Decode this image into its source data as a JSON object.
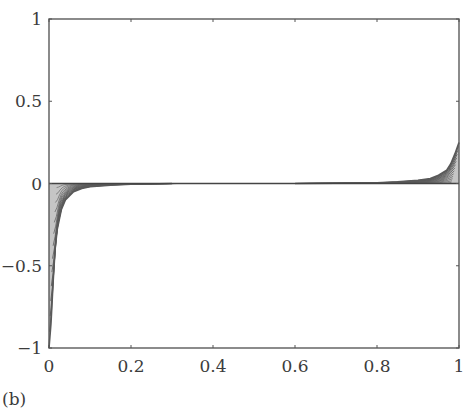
{
  "figure": {
    "panel_label": "(b)"
  },
  "chart_data": {
    "type": "line",
    "title": "",
    "xlabel": "",
    "ylabel": "",
    "xlim": [
      0,
      1
    ],
    "ylim": [
      -1,
      1
    ],
    "grid": false,
    "legend": null,
    "x_ticks": [
      0,
      0.2,
      0.4,
      0.6,
      0.8,
      1
    ],
    "x_tick_labels": [
      "0",
      "0.2",
      "0.4",
      "0.6",
      "0.8",
      "1"
    ],
    "y_ticks": [
      -1,
      -0.5,
      0,
      0.5,
      1
    ],
    "y_tick_labels": [
      "−1",
      "−0.5",
      "0",
      "0.5",
      "1"
    ],
    "series_envelope": [
      {
        "name": "left boundary layer (min envelope)",
        "x": [
          0.0,
          0.005,
          0.01,
          0.015,
          0.02,
          0.03,
          0.04,
          0.06,
          0.08,
          0.1,
          0.15,
          0.2,
          0.3
        ],
        "y": [
          -1.0,
          -0.85,
          -0.6,
          -0.4,
          -0.28,
          -0.16,
          -0.1,
          -0.05,
          -0.03,
          -0.02,
          -0.01,
          -0.005,
          0.0
        ]
      },
      {
        "name": "right boundary layer (max envelope)",
        "x": [
          0.6,
          0.7,
          0.8,
          0.85,
          0.9,
          0.93,
          0.95,
          0.97,
          0.98,
          0.99,
          1.0
        ],
        "y": [
          0.0,
          0.002,
          0.005,
          0.01,
          0.02,
          0.03,
          0.05,
          0.08,
          0.12,
          0.18,
          0.25
        ]
      }
    ],
    "colors": {
      "curves": "#5a5a5a",
      "axes": "#555555"
    }
  }
}
